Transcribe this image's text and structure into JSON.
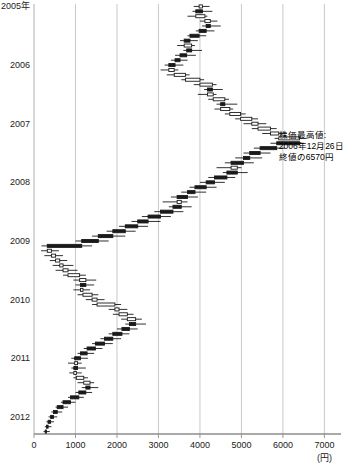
{
  "chart_data": {
    "type": "candlestick",
    "orientation": "horizontal",
    "title": "",
    "xlabel": "(円)",
    "ylabel": "",
    "xlim": [
      0,
      7400
    ],
    "ylim_labels": [
      "2005年",
      "2006",
      "2007",
      "2008",
      "2009",
      "2010",
      "2011",
      "2012"
    ],
    "grid": true,
    "legend": false,
    "xticks": [
      0,
      1000,
      2000,
      3000,
      4000,
      5000,
      6000,
      7000
    ],
    "xticklabels": [
      "0",
      "1000",
      "2000",
      "3000",
      "4000",
      "5000",
      "6000",
      "7000"
    ],
    "yticks_years": [
      {
        "label": "2005年",
        "pos": 0
      },
      {
        "label": "2006",
        "pos": 12
      },
      {
        "label": "2007",
        "pos": 24
      },
      {
        "label": "2008",
        "pos": 36
      },
      {
        "label": "2009",
        "pos": 48
      },
      {
        "label": "2010",
        "pos": 60
      },
      {
        "label": "2011",
        "pos": 72
      },
      {
        "label": "2012",
        "pos": 84
      }
    ],
    "annotations": [
      {
        "name": "peak-annotation",
        "lines": [
          "株価最高値:",
          "2006年12月26日",
          "終値の6570円"
        ],
        "x": 5900,
        "y_pos": 27
      }
    ],
    "unit_note": "(円)",
    "series_name": "株価",
    "candles": [
      {
        "i": 0,
        "open": 3980,
        "high": 4230,
        "low": 3850,
        "close": 4060
      },
      {
        "i": 1,
        "open": 4060,
        "high": 4300,
        "low": 3820,
        "close": 3900
      },
      {
        "i": 2,
        "open": 3900,
        "high": 4180,
        "low": 3700,
        "close": 4120
      },
      {
        "i": 3,
        "open": 4120,
        "high": 4420,
        "low": 4000,
        "close": 4250
      },
      {
        "i": 4,
        "open": 4250,
        "high": 4500,
        "low": 4050,
        "close": 4150
      },
      {
        "i": 5,
        "open": 4150,
        "high": 4350,
        "low": 3900,
        "close": 3980
      },
      {
        "i": 6,
        "open": 3980,
        "high": 4150,
        "low": 3700,
        "close": 3760
      },
      {
        "i": 7,
        "open": 3760,
        "high": 3950,
        "low": 3520,
        "close": 3620
      },
      {
        "i": 8,
        "open": 3620,
        "high": 3880,
        "low": 3450,
        "close": 3800
      },
      {
        "i": 9,
        "open": 3800,
        "high": 4050,
        "low": 3600,
        "close": 3680
      },
      {
        "i": 10,
        "open": 3680,
        "high": 3900,
        "low": 3400,
        "close": 3520
      },
      {
        "i": 11,
        "open": 3520,
        "high": 3700,
        "low": 3300,
        "close": 3400
      },
      {
        "i": 12,
        "open": 3400,
        "high": 3600,
        "low": 3150,
        "close": 3250
      },
      {
        "i": 13,
        "open": 3250,
        "high": 3480,
        "low": 3050,
        "close": 3380
      },
      {
        "i": 14,
        "open": 3380,
        "high": 3750,
        "low": 3200,
        "close": 3650
      },
      {
        "i": 15,
        "open": 3650,
        "high": 4100,
        "low": 3550,
        "close": 4000
      },
      {
        "i": 16,
        "open": 4000,
        "high": 4400,
        "low": 3850,
        "close": 4300
      },
      {
        "i": 17,
        "open": 4300,
        "high": 4550,
        "low": 4100,
        "close": 4180
      },
      {
        "i": 18,
        "open": 4180,
        "high": 4400,
        "low": 3950,
        "close": 4320
      },
      {
        "i": 19,
        "open": 4320,
        "high": 4700,
        "low": 4200,
        "close": 4600
      },
      {
        "i": 20,
        "open": 4600,
        "high": 4900,
        "low": 4400,
        "close": 4500
      },
      {
        "i": 21,
        "open": 4500,
        "high": 4800,
        "low": 4350,
        "close": 4720
      },
      {
        "i": 22,
        "open": 4720,
        "high": 5100,
        "low": 4600,
        "close": 4980
      },
      {
        "i": 23,
        "open": 4980,
        "high": 5400,
        "low": 4850,
        "close": 5250
      },
      {
        "i": 24,
        "open": 5250,
        "high": 5600,
        "low": 5050,
        "close": 5400
      },
      {
        "i": 25,
        "open": 5400,
        "high": 5850,
        "low": 5250,
        "close": 5700
      },
      {
        "i": 26,
        "open": 5700,
        "high": 6100,
        "low": 5500,
        "close": 5900
      },
      {
        "i": 27,
        "open": 5900,
        "high": 6570,
        "low": 5800,
        "close": 6400
      },
      {
        "i": 28,
        "open": 6400,
        "high": 6500,
        "low": 5700,
        "close": 5850
      },
      {
        "i": 29,
        "open": 5850,
        "high": 6050,
        "low": 5300,
        "close": 5450
      },
      {
        "i": 30,
        "open": 5450,
        "high": 5700,
        "low": 5050,
        "close": 5200
      },
      {
        "i": 31,
        "open": 5200,
        "high": 5500,
        "low": 4850,
        "close": 5050
      },
      {
        "i": 32,
        "open": 5050,
        "high": 5300,
        "low": 4600,
        "close": 4750
      },
      {
        "i": 33,
        "open": 4750,
        "high": 5000,
        "low": 4400,
        "close": 4900
      },
      {
        "i": 34,
        "open": 4900,
        "high": 5150,
        "low": 4550,
        "close": 4650
      },
      {
        "i": 35,
        "open": 4650,
        "high": 4850,
        "low": 4200,
        "close": 4350
      },
      {
        "i": 36,
        "open": 4350,
        "high": 4600,
        "low": 4000,
        "close": 4150
      },
      {
        "i": 37,
        "open": 4150,
        "high": 4400,
        "low": 3750,
        "close": 3880
      },
      {
        "i": 38,
        "open": 3880,
        "high": 4150,
        "low": 3550,
        "close": 3700
      },
      {
        "i": 39,
        "open": 3700,
        "high": 3950,
        "low": 3300,
        "close": 3450
      },
      {
        "i": 40,
        "open": 3450,
        "high": 3700,
        "low": 3100,
        "close": 3550
      },
      {
        "i": 41,
        "open": 3550,
        "high": 3800,
        "low": 3250,
        "close": 3350
      },
      {
        "i": 42,
        "open": 3350,
        "high": 3600,
        "low": 2900,
        "close": 3050
      },
      {
        "i": 43,
        "open": 3050,
        "high": 3300,
        "low": 2600,
        "close": 2750
      },
      {
        "i": 44,
        "open": 2750,
        "high": 3050,
        "low": 2350,
        "close": 2500
      },
      {
        "i": 45,
        "open": 2500,
        "high": 2750,
        "low": 2050,
        "close": 2200
      },
      {
        "i": 46,
        "open": 2200,
        "high": 2450,
        "low": 1750,
        "close": 1900
      },
      {
        "i": 47,
        "open": 1900,
        "high": 2200,
        "low": 1400,
        "close": 1550
      },
      {
        "i": 48,
        "open": 1550,
        "high": 1800,
        "low": 1000,
        "close": 1150
      },
      {
        "i": 49,
        "open": 1150,
        "high": 1400,
        "low": 180,
        "close": 320
      },
      {
        "i": 50,
        "open": 320,
        "high": 600,
        "low": 170,
        "close": 420
      },
      {
        "i": 51,
        "open": 420,
        "high": 700,
        "low": 250,
        "close": 520
      },
      {
        "i": 52,
        "open": 520,
        "high": 800,
        "low": 380,
        "close": 620
      },
      {
        "i": 53,
        "open": 620,
        "high": 950,
        "low": 450,
        "close": 700
      },
      {
        "i": 54,
        "open": 700,
        "high": 1050,
        "low": 520,
        "close": 820
      },
      {
        "i": 55,
        "open": 820,
        "high": 1250,
        "low": 700,
        "close": 1100
      },
      {
        "i": 56,
        "open": 1100,
        "high": 1500,
        "low": 950,
        "close": 1250
      },
      {
        "i": 57,
        "open": 1250,
        "high": 1450,
        "low": 1000,
        "close": 1120
      },
      {
        "i": 58,
        "open": 1120,
        "high": 1350,
        "low": 950,
        "close": 1180
      },
      {
        "i": 59,
        "open": 1180,
        "high": 1550,
        "low": 1050,
        "close": 1400
      },
      {
        "i": 60,
        "open": 1400,
        "high": 1700,
        "low": 1250,
        "close": 1520
      },
      {
        "i": 61,
        "open": 1520,
        "high": 2100,
        "low": 1400,
        "close": 1950
      },
      {
        "i": 62,
        "open": 1950,
        "high": 2250,
        "low": 1800,
        "close": 2050
      },
      {
        "i": 63,
        "open": 2050,
        "high": 2400,
        "low": 1900,
        "close": 2250
      },
      {
        "i": 64,
        "open": 2250,
        "high": 2600,
        "low": 2100,
        "close": 2450
      },
      {
        "i": 65,
        "open": 2450,
        "high": 2700,
        "low": 2200,
        "close": 2300
      },
      {
        "i": 66,
        "open": 2300,
        "high": 2500,
        "low": 2000,
        "close": 2120
      },
      {
        "i": 67,
        "open": 2120,
        "high": 2300,
        "low": 1800,
        "close": 1900
      },
      {
        "i": 68,
        "open": 1900,
        "high": 2100,
        "low": 1600,
        "close": 1700
      },
      {
        "i": 69,
        "open": 1700,
        "high": 1900,
        "low": 1400,
        "close": 1480
      },
      {
        "i": 70,
        "open": 1480,
        "high": 1650,
        "low": 1200,
        "close": 1280
      },
      {
        "i": 71,
        "open": 1280,
        "high": 1450,
        "low": 1050,
        "close": 1120
      },
      {
        "i": 72,
        "open": 1120,
        "high": 1300,
        "low": 900,
        "close": 980
      },
      {
        "i": 73,
        "open": 980,
        "high": 1150,
        "low": 820,
        "close": 1050
      },
      {
        "i": 74,
        "open": 1050,
        "high": 1250,
        "low": 900,
        "close": 960
      },
      {
        "i": 75,
        "open": 960,
        "high": 1150,
        "low": 850,
        "close": 1020
      },
      {
        "i": 76,
        "open": 1020,
        "high": 1300,
        "low": 950,
        "close": 1200
      },
      {
        "i": 77,
        "open": 1200,
        "high": 1450,
        "low": 1050,
        "close": 1350
      },
      {
        "i": 78,
        "open": 1350,
        "high": 1550,
        "low": 1150,
        "close": 1250
      },
      {
        "i": 79,
        "open": 1250,
        "high": 1400,
        "low": 1000,
        "close": 1080
      },
      {
        "i": 80,
        "open": 1080,
        "high": 1200,
        "low": 820,
        "close": 880
      },
      {
        "i": 81,
        "open": 880,
        "high": 1000,
        "low": 650,
        "close": 700
      },
      {
        "i": 82,
        "open": 700,
        "high": 820,
        "low": 520,
        "close": 560
      },
      {
        "i": 83,
        "open": 560,
        "high": 680,
        "low": 420,
        "close": 470
      },
      {
        "i": 84,
        "open": 470,
        "high": 560,
        "low": 350,
        "close": 400
      },
      {
        "i": 85,
        "open": 400,
        "high": 480,
        "low": 300,
        "close": 340
      },
      {
        "i": 86,
        "open": 340,
        "high": 420,
        "low": 260,
        "close": 300
      },
      {
        "i": 87,
        "open": 300,
        "high": 380,
        "low": 230,
        "close": 270
      }
    ]
  }
}
